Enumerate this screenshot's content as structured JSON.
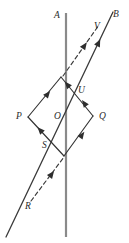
{
  "figure": {
    "type": "geometry-diagram",
    "canvas": {
      "width": 129,
      "height": 243,
      "background": "#ffffff"
    },
    "colors": {
      "vertical_line": "#8a8a8a",
      "edges": "#333333",
      "rays": "#3a3a3a",
      "arrow_fill": "#2e2e2e",
      "label_text": "#2b2b2b"
    },
    "labels": [
      {
        "id": "A",
        "text": "A",
        "x": 57,
        "y": 16
      },
      {
        "id": "B",
        "text": "B",
        "x": 116,
        "y": 15
      },
      {
        "id": "V",
        "text": "V",
        "x": 97,
        "y": 27
      },
      {
        "id": "U",
        "text": "U",
        "x": 81,
        "y": 91
      },
      {
        "id": "P",
        "text": "P",
        "x": 19,
        "y": 117
      },
      {
        "id": "O",
        "text": "O",
        "x": 57,
        "y": 117
      },
      {
        "id": "Q",
        "text": "Q",
        "x": 101,
        "y": 117
      },
      {
        "id": "S",
        "text": "S",
        "x": 45,
        "y": 146
      },
      {
        "id": "R",
        "text": "R",
        "x": 28,
        "y": 207
      }
    ],
    "vertical_line": {
      "name": "line-A",
      "x": 66,
      "y1": 13,
      "y2": 237
    },
    "diagonal_line": {
      "name": "line-RB",
      "x1": 6,
      "y1": 237,
      "x2": 113,
      "y2": 12,
      "endpoint_labels": [
        "R",
        "B"
      ]
    },
    "rhombus": {
      "name": "rhombus-POQ",
      "vertices": {
        "top": {
          "x": 61,
          "y": 77
        },
        "left": {
          "x": 28,
          "y": 117
        },
        "bottom": {
          "x": 64,
          "y": 156
        },
        "right": {
          "x": 93,
          "y": 116
        }
      },
      "edges": [
        {
          "from": "left",
          "to": "top",
          "arrow_at": 0.5,
          "style": "solid"
        },
        {
          "from": "top",
          "to": "right",
          "arrow_at": 0.45,
          "style": "solid"
        },
        {
          "from": "bottom",
          "to": "right",
          "arrow_at": 0.55,
          "style": "solid"
        },
        {
          "from": "left",
          "to": "bottom",
          "arrow_at": 0.5,
          "style": "solid"
        }
      ]
    },
    "dashed_rays": [
      {
        "name": "dashed-top",
        "x1": 63,
        "y1": 76,
        "x2": 99,
        "y2": 25,
        "arrow_at": 0.55
      },
      {
        "name": "dashed-bottom",
        "x1": 31,
        "y1": 201,
        "x2": 64,
        "y2": 157,
        "arrow_at": 0.58
      }
    ],
    "legend_note": ""
  }
}
